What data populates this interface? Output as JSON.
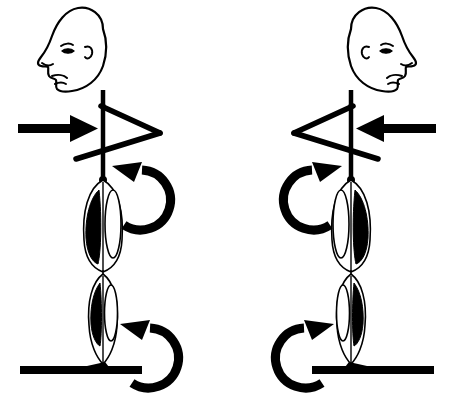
{
  "image": {
    "title": "Stick figure pair showing opposing torque and force directions",
    "background_color": "#ffffff",
    "ink_color": "#000000",
    "width": 454,
    "height": 419
  },
  "figures": [
    {
      "id": "left-figure",
      "label": "left-figure",
      "facing": "left",
      "origin_x": 0,
      "mirrored": false,
      "parts": {
        "head": "head-profile-facing-left",
        "neck": "neck-line",
        "torso": "torso-vertical-line",
        "arm": "arm-triangle-pointing-right",
        "thigh": "thigh-muscle-segment",
        "calf": "calf-muscle-segment",
        "foot": "foot-wedge-pointing-left",
        "ground": "ground-bar"
      },
      "annotations": {
        "straight_arrow": {
          "name": "force-arrow",
          "direction": "rightward",
          "points_toward": "body",
          "from_x": 18,
          "to_x": 98,
          "y": 128
        },
        "upper_curved_arrow": {
          "name": "hip-torque-arrow",
          "direction": "counterclockwise",
          "arrowhead_at": "top-left",
          "center_y": 212
        },
        "lower_curved_arrow": {
          "name": "ankle-torque-arrow",
          "direction": "counterclockwise",
          "arrowhead_at": "top-left",
          "center_y": 365
        }
      }
    },
    {
      "id": "right-figure",
      "label": "right-figure",
      "facing": "left",
      "origin_x": 227,
      "mirrored": true,
      "parts": {
        "head": "head-profile-facing-left",
        "neck": "neck-line",
        "torso": "torso-vertical-line",
        "arm": "arm-triangle-pointing-right",
        "thigh": "thigh-muscle-segment",
        "calf": "calf-muscle-segment",
        "foot": "foot-wedge-pointing-right",
        "ground": "ground-bar"
      },
      "annotations": {
        "straight_arrow": {
          "name": "force-arrow",
          "direction": "leftward",
          "points_toward": "body",
          "from_x": 436,
          "to_x": 356,
          "y": 128
        },
        "upper_curved_arrow": {
          "name": "hip-torque-arrow",
          "direction": "clockwise",
          "arrowhead_at": "top-right",
          "center_y": 212
        },
        "lower_curved_arrow": {
          "name": "ankle-torque-arrow",
          "direction": "clockwise",
          "arrowhead_at": "top-right",
          "center_y": 365
        }
      }
    }
  ]
}
